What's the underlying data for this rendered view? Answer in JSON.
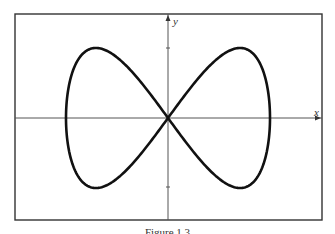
{
  "figure": {
    "x_label": "x",
    "y_label": "y",
    "caption": "Figure 1.3",
    "colors": {
      "frame": "#333333",
      "axes": "#555555",
      "curve": "#111111",
      "background": "#ffffff"
    }
  },
  "curve": {
    "type": "parametric",
    "description": "figure-eight (lemniscate-like) curve crossing at origin",
    "x_of_t": "sin(t)",
    "y_of_t": "sin(2t)",
    "y_ticks": [
      1,
      -1
    ]
  }
}
